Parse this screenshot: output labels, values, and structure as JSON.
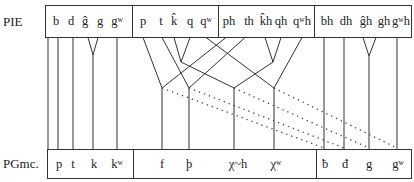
{
  "labels": {
    "top_row": "PIE",
    "bottom_row": "PGmc."
  },
  "pie_groups": [
    {
      "name": "voiced",
      "items": [
        "b",
        "d",
        "ĝ",
        "g",
        "gʷ"
      ]
    },
    {
      "name": "voiceless",
      "items": [
        "p",
        "t",
        "k̂",
        "q",
        "qʷ"
      ]
    },
    {
      "name": "voiceless-aspirated",
      "items": [
        "ph",
        "th",
        "k̂h",
        "qh",
        "qʷh"
      ]
    },
    {
      "name": "voiced-aspirated",
      "items": [
        "bh",
        "dh",
        "ĝh",
        "gh",
        "gʷh"
      ]
    }
  ],
  "pgmc_groups": [
    {
      "name": "stops",
      "items": [
        "p",
        "t",
        "k",
        "kʷ"
      ]
    },
    {
      "name": "fricatives",
      "items": [
        "f",
        "þ",
        "χ~h",
        "χʷ"
      ]
    },
    {
      "name": "voiced-fricatives",
      "items": [
        "ƀ",
        "đ",
        "g",
        "gʷ"
      ]
    }
  ],
  "colors": {
    "line": "#333333",
    "dotted": "#444444",
    "text": "#222222",
    "background": "#ffffff"
  }
}
